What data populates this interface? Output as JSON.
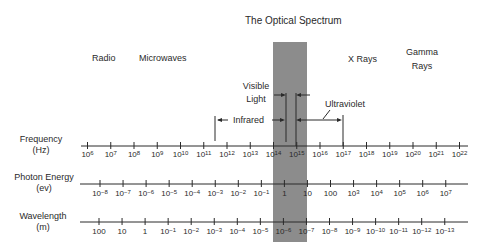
{
  "title": "The Optical Spectrum",
  "bands": {
    "radio": "Radio",
    "microwaves": "Microwaves",
    "xrays": "X Rays",
    "gamma_line1": "Gamma",
    "gamma_line2": "Rays",
    "visible_line1": "Visible",
    "visible_line2": "Light",
    "infrared": "Infrared",
    "ultraviolet": "Ultraviolet"
  },
  "axes": {
    "frequency": {
      "label": "Frequency",
      "unit": "(Hz)",
      "ticks": [
        [
          "10",
          "6"
        ],
        [
          "10",
          "7"
        ],
        [
          "10",
          "8"
        ],
        [
          "10",
          "9"
        ],
        [
          "10",
          "10"
        ],
        [
          "10",
          "11"
        ],
        [
          "10",
          "12"
        ],
        [
          "10",
          "13"
        ],
        [
          "10",
          "14"
        ],
        [
          "10",
          "15"
        ],
        [
          "10",
          "16"
        ],
        [
          "10",
          "17"
        ],
        [
          "10",
          "18"
        ],
        [
          "10",
          "19"
        ],
        [
          "10",
          "20"
        ],
        [
          "10",
          "21"
        ],
        [
          "10",
          "22"
        ]
      ]
    },
    "photon_energy": {
      "label": "Photon Energy",
      "unit": "(ev)",
      "ticks": [
        [
          "10",
          "−8"
        ],
        [
          "10",
          "−7"
        ],
        [
          "10",
          "−6"
        ],
        [
          "10",
          "−5"
        ],
        [
          "10",
          "−4"
        ],
        [
          "10",
          "−3"
        ],
        [
          "10",
          "−2"
        ],
        [
          "10",
          "−1"
        ],
        [
          "1",
          ""
        ],
        [
          "10",
          ""
        ],
        [
          "100",
          ""
        ],
        [
          "10",
          "3"
        ],
        [
          "10",
          "4"
        ],
        [
          "10",
          "5"
        ],
        [
          "10",
          "6"
        ],
        [
          "10",
          "7"
        ]
      ]
    },
    "wavelength": {
      "label": "Wavelength",
      "unit": "(m)",
      "ticks": [
        [
          "100",
          ""
        ],
        [
          "10",
          ""
        ],
        [
          "1",
          ""
        ],
        [
          "10",
          "−1"
        ],
        [
          "10",
          "−2"
        ],
        [
          "10",
          "−3"
        ],
        [
          "10",
          "−4"
        ],
        [
          "10",
          "−5"
        ],
        [
          "10",
          "−6"
        ],
        [
          "10",
          "−7"
        ],
        [
          "10",
          "−8"
        ],
        [
          "10",
          "−9"
        ],
        [
          "10",
          "−10"
        ],
        [
          "10",
          "−11"
        ],
        [
          "10",
          "−12"
        ],
        [
          "10",
          "−13"
        ]
      ]
    }
  },
  "colors": {
    "optical_band": "#8c8c8c",
    "ink": "#2a2a2a",
    "background": "#ffffff"
  }
}
